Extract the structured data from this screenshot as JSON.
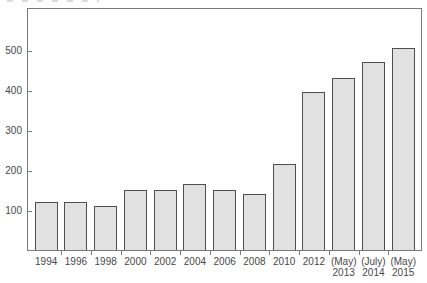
{
  "chart_data": {
    "type": "bar",
    "title": "",
    "xlabel": "",
    "ylabel": "",
    "categories": [
      "1994",
      "1996",
      "1998",
      "2000",
      "2002",
      "2004",
      "2006",
      "2008",
      "2010",
      "2012",
      "(May) 2013",
      "(July) 2014",
      "(May) 2015"
    ],
    "tick_lines": [
      [
        "1994"
      ],
      [
        "1996"
      ],
      [
        "1998"
      ],
      [
        "2000"
      ],
      [
        "2002"
      ],
      [
        "2004"
      ],
      [
        "2006"
      ],
      [
        "2008"
      ],
      [
        "2010"
      ],
      [
        "2012"
      ],
      [
        "(May)",
        "2013"
      ],
      [
        "(July)",
        "2014"
      ],
      [
        "(May)",
        "2015"
      ]
    ],
    "values": [
      120,
      119,
      111,
      151,
      151,
      165,
      150,
      139,
      216,
      394,
      430,
      470,
      505
    ],
    "yticks": [
      100,
      200,
      300,
      400,
      500
    ],
    "ylim": [
      0,
      610
    ],
    "grid": false,
    "legend": "none",
    "colors": {
      "background": "#ffffff",
      "bar_fill": "#e1e1e1",
      "bar_border": "#4f4f4f",
      "frame": "#7a7a7a",
      "text": "#474747"
    }
  }
}
